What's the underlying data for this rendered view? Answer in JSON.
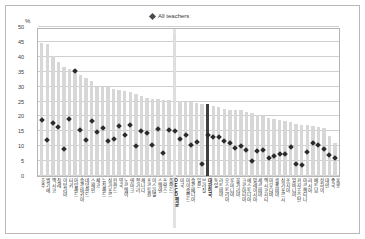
{
  "figure": {
    "axis_unit": "%",
    "legend": {
      "label": "All teachers",
      "marker": "diamond-marker",
      "color": "#2b2b2b"
    }
  },
  "colors": {
    "bar": "#d7d7d7",
    "bar_highlight_oecd": "#e2e2e2",
    "bar_highlight_korea": "#3f3f3f",
    "marker": "#2b2b2b",
    "gridline": "#cfcfcf",
    "border": "#b5b5b5"
  },
  "chart_data": {
    "type": "bar",
    "title": "",
    "subtitle": "",
    "xlabel": "",
    "ylabel": "%",
    "ylim": [
      0,
      50
    ],
    "yticks": [
      0,
      5,
      10,
      15,
      20,
      25,
      30,
      35,
      40,
      45,
      50
    ],
    "grid": true,
    "legend_position": "top-center",
    "legend_entries": [
      "All teachers"
    ],
    "annotations": [
      "OECD average column highlighted with a pale band extending below the axis",
      "Korea column drawn in dark fill"
    ],
    "categories": [
      "호주",
      "벨기에",
      "멕시코",
      "칠레",
      "이탈리아",
      "터키",
      "아일랜드",
      "슬로바키아",
      "네덜란드",
      "스페인",
      "체코",
      "뉴질랜드",
      "싱가포르",
      "핀란드",
      "영국",
      "노르웨이",
      "덴마크",
      "헝가리",
      "캐나다",
      "포르투갈",
      "이스라엘",
      "스웨덴",
      "프랑스",
      "폴란드",
      "OECD평균",
      "미국",
      "아이슬란드",
      "슬로베니아",
      "일본",
      "브라질",
      "대한민국",
      "독일",
      "라트비아",
      "오스트리아",
      "루마니아",
      "불가리아",
      "크로아티아",
      "에스토니아",
      "말레이시아",
      "세르비아",
      "멕시코시티",
      "아부다비",
      "콜롬비아",
      "싱가포르시",
      "조지아",
      "알바니아",
      "카자흐스탄",
      "아르헨티나",
      "러시아",
      "베트남",
      "상하이",
      "대만",
      "중국",
      "홍콩"
    ],
    "series": [
      {
        "name": "Bars (share, %)",
        "values": [
          44.8,
          44.4,
          40.3,
          38.2,
          36.5,
          35.8,
          35.8,
          34.0,
          33.0,
          32.0,
          30.0,
          30.0,
          29.8,
          29.3,
          28.8,
          28.6,
          28.2,
          27.6,
          27.0,
          26.3,
          26.0,
          25.8,
          25.6,
          25.5,
          47.5,
          25.3,
          25.0,
          24.8,
          24.5,
          24.3,
          24.0,
          23.6,
          23.0,
          22.5,
          22.3,
          22.2,
          22.0,
          21.5,
          21.0,
          20.5,
          20.0,
          19.5,
          19.0,
          18.8,
          18.5,
          18.0,
          17.5,
          17.2,
          17.0,
          16.8,
          16.5,
          16.2,
          13.5,
          11.0
        ]
      },
      {
        "name": "All teachers (marker, %)",
        "values": [
          18.8,
          12.2,
          17.7,
          16.4,
          8.9,
          19.1,
          35.2,
          15.5,
          12.1,
          18.5,
          14.8,
          16.0,
          11.8,
          12.5,
          16.9,
          13.8,
          17.1,
          10.1,
          15.2,
          14.4,
          10.3,
          15.9,
          7.7,
          15.6,
          15.2,
          12.4,
          13.9,
          10.5,
          11.4,
          4.0,
          13.9,
          13.1,
          13.1,
          11.9,
          11.2,
          9.3,
          10.0,
          8.6,
          4.9,
          8.4,
          8.8,
          5.9,
          6.7,
          7.3,
          7.3,
          9.6,
          3.9,
          3.6,
          8.2,
          11.0,
          10.5,
          9.0,
          7.0,
          6.0
        ]
      }
    ],
    "highlight": {
      "oecd_average_index": 24,
      "korea_index": 30,
      "oecd_average_label": "OECD평균",
      "korea_label": "대한민국"
    }
  }
}
